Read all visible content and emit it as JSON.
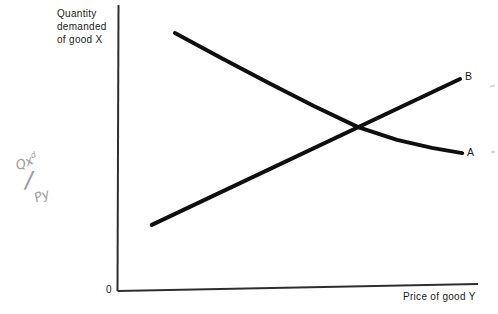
{
  "figure": {
    "y_axis_label_lines": [
      "Quantity",
      "demanded",
      "of good X"
    ],
    "x_axis_label": "Price of good Y",
    "origin_label": "0",
    "curve_a_label": "A",
    "curve_b_label": "B"
  },
  "handwritten_annotation": {
    "numerator_base": "Qx",
    "numerator_sup": "d",
    "slash": "/",
    "denominator": "Py"
  },
  "colors": {
    "background": "#ffffff",
    "curve": "#0f0f0f",
    "axis": "#2e2e2e",
    "text": "#1a1a1a",
    "pencil": "#9c9c9c"
  },
  "chart_data": {
    "type": "line",
    "title": "",
    "xlabel": "Price of good Y",
    "ylabel": "Quantity demanded of good X",
    "axes_numeric": false,
    "grid": false,
    "legend": "curve-end inline labels A and B",
    "x_range_normalized": [
      0,
      1
    ],
    "y_range_normalized": [
      0,
      1
    ],
    "series": [
      {
        "name": "A",
        "description": "downward-sloping convex curve (demand for X falls at a decreasing rate as price of Y rises)",
        "x": [
          0.158,
          0.292,
          0.419,
          0.544,
          0.667,
          0.775,
          0.872,
          0.956
        ],
        "y": [
          0.905,
          0.814,
          0.73,
          0.649,
          0.575,
          0.53,
          0.502,
          0.484
        ]
      },
      {
        "name": "B",
        "description": "upward-sloping straight line (demand for X rises as price of Y rises)",
        "x": [
          0.094,
          0.95
        ],
        "y": [
          0.232,
          0.744
        ]
      }
    ],
    "intersection_normalized": {
      "x": 0.667,
      "y": 0.575
    }
  }
}
